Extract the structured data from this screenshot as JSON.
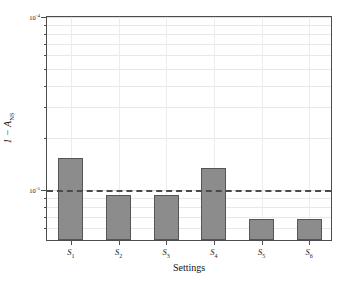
{
  "chart_data": {
    "type": "bar",
    "title": "",
    "xlabel": "Settings",
    "ylabel": "1 − A_NS",
    "ylabel_main": "1 − A",
    "ylabel_sub": "NS",
    "categories": [
      "S1",
      "S2",
      "S3",
      "S4",
      "S5",
      "S6"
    ],
    "category_labels": [
      {
        "base": "S",
        "sub": "1"
      },
      {
        "base": "S",
        "sub": "2"
      },
      {
        "base": "S",
        "sub": "3"
      },
      {
        "base": "S",
        "sub": "4"
      },
      {
        "base": "S",
        "sub": "5"
      },
      {
        "base": "S",
        "sub": "6"
      }
    ],
    "values": [
      1.5e-05,
      9.1e-06,
      9.1e-06,
      1.3e-05,
      6.6e-06,
      6.6e-06
    ],
    "yscale": "log",
    "ylim": [
      5e-06,
      0.0001
    ],
    "ytick_values": [
      0.0001,
      1e-05
    ],
    "ytick_labels": [
      {
        "mantissa": "10",
        "exponent": "-4"
      },
      {
        "mantissa": "10",
        "exponent": "-5"
      }
    ],
    "minor_ytick_values": [
      9e-05,
      8e-05,
      7e-05,
      6e-05,
      5e-05,
      4e-05,
      3e-05,
      2e-05,
      9e-06,
      8e-06,
      7e-06,
      6e-06
    ],
    "reference_line": {
      "value": 1e-05,
      "style": "dashed",
      "color": "#4a4a4a"
    },
    "grid": true,
    "legend": "none",
    "bar_color": "#8c8c8c",
    "bar_edge_color": "#555555",
    "axis_color": "#4d4d4d",
    "background_color": "#ffffff"
  }
}
